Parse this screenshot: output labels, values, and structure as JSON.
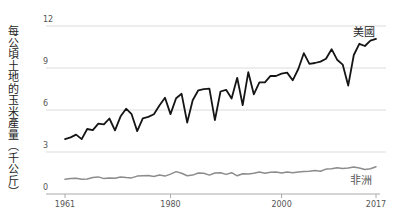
{
  "colors": {
    "background": "#ffffff",
    "gridline": "#dcdcdc",
    "axis": "#aaaaaa",
    "tick_text": "#555555",
    "usa_line": "#151515",
    "africa_line": "#8c8c8c",
    "usa_label_text": "#2a2a2a",
    "africa_label_text": "#555555",
    "ylabel_text": "#222222"
  },
  "chart_data": {
    "type": "line",
    "title": "",
    "xlabel": "",
    "ylabel": "每公頃土地的玉米產量（千公斤）",
    "ylim": [
      0,
      12
    ],
    "xlim": [
      1961,
      2017
    ],
    "yticks": [
      0,
      3,
      6,
      9,
      12
    ],
    "xticks": [
      1961,
      1980,
      2000,
      2017
    ],
    "grid": "horizontal",
    "legend_position": "end-of-line-labels",
    "x": [
      1961,
      1962,
      1963,
      1964,
      1965,
      1966,
      1967,
      1968,
      1969,
      1970,
      1971,
      1972,
      1973,
      1974,
      1975,
      1976,
      1977,
      1978,
      1979,
      1980,
      1981,
      1982,
      1983,
      1984,
      1985,
      1986,
      1987,
      1988,
      1989,
      1990,
      1991,
      1992,
      1993,
      1994,
      1995,
      1996,
      1997,
      1998,
      1999,
      2000,
      2001,
      2002,
      2003,
      2004,
      2005,
      2006,
      2007,
      2008,
      2009,
      2010,
      2011,
      2012,
      2013,
      2014,
      2015,
      2016,
      2017
    ],
    "series": [
      {
        "name": "美國",
        "values": [
          3.92,
          4.04,
          4.24,
          3.92,
          4.64,
          4.56,
          5.02,
          4.97,
          5.39,
          4.54,
          5.53,
          6.09,
          5.7,
          4.49,
          5.41,
          5.51,
          5.69,
          6.32,
          6.88,
          5.71,
          6.84,
          7.16,
          5.11,
          6.7,
          7.41,
          7.49,
          7.52,
          5.28,
          7.32,
          7.44,
          6.82,
          8.3,
          6.34,
          8.7,
          7.12,
          7.98,
          7.97,
          8.44,
          8.43,
          8.6,
          8.67,
          8.12,
          8.93,
          10.06,
          9.29,
          9.36,
          9.46,
          9.66,
          10.34,
          9.59,
          9.24,
          7.74,
          9.93,
          10.73,
          10.57,
          10.96,
          11.08
        ]
      },
      {
        "name": "非洲",
        "values": [
          1.05,
          1.1,
          1.12,
          1.05,
          1.08,
          1.18,
          1.22,
          1.1,
          1.15,
          1.12,
          1.22,
          1.18,
          1.15,
          1.28,
          1.3,
          1.33,
          1.25,
          1.35,
          1.28,
          1.42,
          1.6,
          1.48,
          1.3,
          1.35,
          1.5,
          1.48,
          1.35,
          1.5,
          1.52,
          1.4,
          1.52,
          1.3,
          1.45,
          1.42,
          1.48,
          1.58,
          1.48,
          1.55,
          1.58,
          1.5,
          1.58,
          1.52,
          1.58,
          1.6,
          1.62,
          1.68,
          1.62,
          1.78,
          1.8,
          1.88,
          1.82,
          1.85,
          1.92,
          1.85,
          1.75,
          1.8,
          1.95
        ]
      }
    ]
  }
}
